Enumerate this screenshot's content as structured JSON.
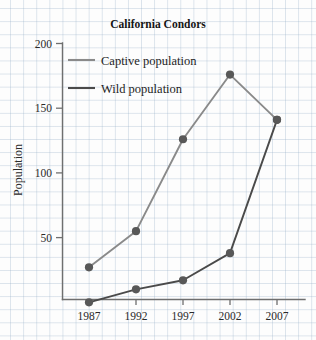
{
  "chart_data": {
    "type": "line",
    "title": "California Condors",
    "xlabel": "",
    "ylabel": "Population",
    "categories": [
      "1987",
      "1992",
      "1997",
      "2002",
      "2007"
    ],
    "x": [
      1987,
      1992,
      1997,
      2002,
      2007
    ],
    "series": [
      {
        "name": "Captive population",
        "values": [
          27,
          55,
          126,
          176,
          141
        ],
        "color": "#8a8a8a",
        "marker": "filled-circle"
      },
      {
        "name": "Wild population",
        "values": [
          0,
          10,
          17,
          38,
          141
        ],
        "color": "#4a4a4a",
        "marker": "filled-circle"
      }
    ],
    "ylim": [
      0,
      200
    ],
    "yticks": [
      50,
      100,
      150,
      200
    ],
    "ytick_labels": [
      "50",
      "100",
      "150",
      "200"
    ],
    "xlim": [
      1985,
      2009
    ],
    "grid": true,
    "grid_style": "graph-paper",
    "legend_position": "upper-left-inside"
  },
  "axes": {
    "y_title": "Population",
    "y_tick_labels": [
      "200",
      "150",
      "100",
      "50"
    ],
    "x_tick_labels": [
      "1987",
      "1992",
      "1997",
      "2002",
      "2007"
    ]
  },
  "legend": {
    "entries": [
      {
        "label": "Captive population"
      },
      {
        "label": "Wild population"
      }
    ]
  },
  "colors": {
    "captive": "#8a8a8a",
    "wild": "#4a4a4a",
    "marker": "#585858",
    "axis": "#6f6f6f",
    "grid": "#96afc8",
    "text": "#1d1d1d",
    "background": "#fdfdfd"
  }
}
